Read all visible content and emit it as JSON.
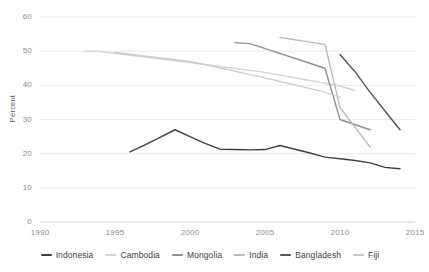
{
  "chart_data": {
    "type": "line",
    "title": "",
    "xlabel": "",
    "ylabel": "Percent",
    "xlim": [
      1990,
      2015
    ],
    "ylim": [
      0,
      60
    ],
    "grid": true,
    "legend_position": "bottom",
    "x_ticks": [
      "1990",
      "1995",
      "2000",
      "2005",
      "2010",
      "2015"
    ],
    "y_ticks": [
      "0",
      "10",
      "20",
      "30",
      "40",
      "50",
      "60"
    ],
    "series": [
      {
        "name": "Indonesia",
        "color": "#3f4144",
        "x": [
          1996,
          1997,
          1998,
          1999,
          2000,
          2001,
          2002,
          2003,
          2004,
          2005,
          2006,
          2007,
          2008,
          2009,
          2010,
          2011,
          2012,
          2013,
          2014
        ],
        "values": [
          20.5,
          22.6,
          24.8,
          27.0,
          25.0,
          23.0,
          21.3,
          21.2,
          21.1,
          21.2,
          22.4,
          21.3,
          20.2,
          19.0,
          18.5,
          18.0,
          17.3,
          16.0,
          15.6
        ]
      },
      {
        "name": "Cambodia",
        "color": "#d2d3d5",
        "x": [
          1993,
          1994,
          2000,
          2005,
          2010,
          2011
        ],
        "values": [
          50.0,
          49.9,
          46.7,
          43.8,
          39.8,
          38.5
        ]
      },
      {
        "name": "Mongolia",
        "color": "#8e9093",
        "x": [
          2003,
          2004,
          2009,
          2010,
          2012
        ],
        "values": [
          52.5,
          52.2,
          45.0,
          30.0,
          27.0
        ]
      },
      {
        "name": "India",
        "color": "#b9babc",
        "x": [
          2006,
          2009,
          2010,
          2012
        ],
        "values": [
          54.0,
          52.0,
          33.5,
          22.0
        ]
      },
      {
        "name": "Bangladesh",
        "color": "#55575a",
        "x": [
          2010,
          2011,
          2012,
          2013,
          2014
        ],
        "values": [
          49.0,
          44.0,
          38.0,
          32.5,
          27.0
        ]
      },
      {
        "name": "Fiji",
        "color": "#cacbcd",
        "x": [
          1995,
          2000,
          2005,
          2009,
          2010
        ],
        "values": [
          49.6,
          47.0,
          42.2,
          38.0,
          36.5
        ]
      }
    ]
  },
  "legend": {
    "items": [
      {
        "label": "Indonesia"
      },
      {
        "label": "Cambodia"
      },
      {
        "label": "Mongolia"
      },
      {
        "label": "India"
      },
      {
        "label": "Bangladesh"
      },
      {
        "label": "Fiji"
      }
    ]
  }
}
